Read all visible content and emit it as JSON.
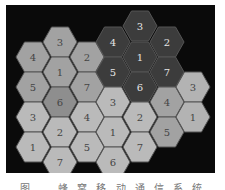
{
  "figure": {
    "caption": "图 … 蜂 窝 移 动 通 信 系 统",
    "panel_background": "#0a0a0a",
    "grid": {
      "col_x": [
        33,
        60,
        87,
        113,
        140,
        167,
        193
      ],
      "row_step": 30,
      "hex_radius": 17
    }
  },
  "colors": {
    "dark": "#3c3c3c",
    "medium": "#a2a2a2",
    "medium_dark": "#8e8e8e",
    "light": "#bababa",
    "lighter": "#b3b3b3",
    "edge": "#555555",
    "label_dark_text": "#e6e6e6",
    "label_light_text": "#444444"
  },
  "cells": [
    {
      "label": "3",
      "col": 4,
      "y": 26,
      "shade": "dark"
    },
    {
      "label": "4",
      "col": 3,
      "y": 42,
      "shade": "dark"
    },
    {
      "label": "2",
      "col": 5,
      "y": 42,
      "shade": "dark"
    },
    {
      "label": "1",
      "col": 4,
      "y": 57,
      "shade": "dark"
    },
    {
      "label": "5",
      "col": 3,
      "y": 72,
      "shade": "dark"
    },
    {
      "label": "7",
      "col": 5,
      "y": 72,
      "shade": "dark"
    },
    {
      "label": "6",
      "col": 4,
      "y": 87,
      "shade": "dark"
    },
    {
      "label": "3",
      "col": 1,
      "y": 42,
      "shade": "medium"
    },
    {
      "label": "4",
      "col": 0,
      "y": 57,
      "shade": "medium"
    },
    {
      "label": "2",
      "col": 2,
      "y": 57,
      "shade": "medium"
    },
    {
      "label": "1",
      "col": 1,
      "y": 72,
      "shade": "medium"
    },
    {
      "label": "5",
      "col": 0,
      "y": 87,
      "shade": "medium"
    },
    {
      "label": "7",
      "col": 2,
      "y": 87,
      "shade": "medium"
    },
    {
      "label": "6",
      "col": 1,
      "y": 102,
      "shade": "medium_dark"
    },
    {
      "label": "3",
      "col": 0,
      "y": 117,
      "shade": "light"
    },
    {
      "label": "4",
      "col": 2,
      "y": 117,
      "shade": "light"
    },
    {
      "label": "2",
      "col": 1,
      "y": 132,
      "shade": "light"
    },
    {
      "label": "1",
      "col": 0,
      "y": 147,
      "shade": "light"
    },
    {
      "label": "5",
      "col": 2,
      "y": 147,
      "shade": "light"
    },
    {
      "label": "7",
      "col": 1,
      "y": 162,
      "shade": "light"
    },
    {
      "label": "3",
      "col": 3,
      "y": 102,
      "shade": "light"
    },
    {
      "label": "2",
      "col": 4,
      "y": 117,
      "shade": "light"
    },
    {
      "label": "1",
      "col": 3,
      "y": 132,
      "shade": "light"
    },
    {
      "label": "7",
      "col": 4,
      "y": 147,
      "shade": "light"
    },
    {
      "label": "6",
      "col": 3,
      "y": 162,
      "shade": "light"
    },
    {
      "label": "4",
      "col": 5,
      "y": 102,
      "shade": "medium"
    },
    {
      "label": "5",
      "col": 5,
      "y": 132,
      "shade": "medium"
    },
    {
      "label": "3",
      "col": 6,
      "y": 87,
      "shade": "lighter"
    },
    {
      "label": "1",
      "col": 6,
      "y": 117,
      "shade": "lighter"
    }
  ]
}
